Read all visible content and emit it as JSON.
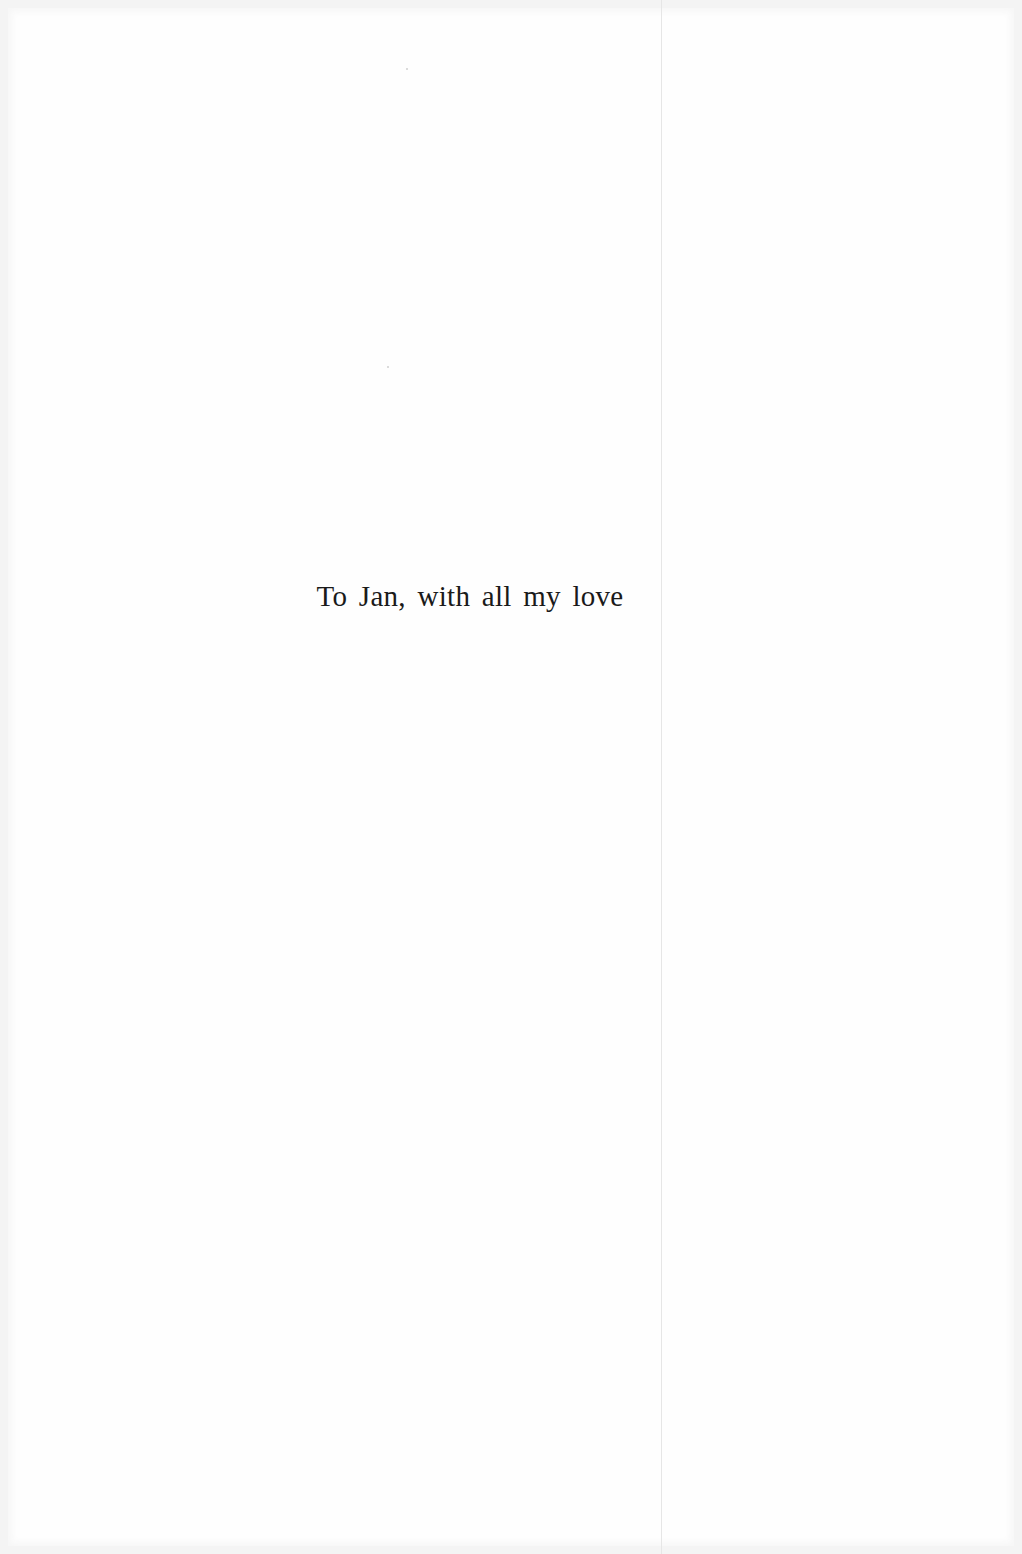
{
  "page": {
    "type": "dedication",
    "dedication_text": "To Jan, with all my love"
  },
  "colors": {
    "background": "#fefefe",
    "border": "#f4f4f4",
    "text": "#1a1a1a",
    "gutter_line": "#e6e6e6"
  }
}
